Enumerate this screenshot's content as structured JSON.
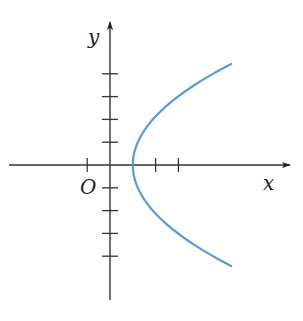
{
  "chart_data": {
    "type": "line",
    "title": "",
    "xlabel": "x",
    "ylabel": "y",
    "origin_label": "O",
    "xlim": [
      -4.4,
      7.6
    ],
    "ylim": [
      -5.9,
      6.3
    ],
    "x_ticks": [
      -1,
      2,
      3
    ],
    "y_ticks": [
      -4,
      -3,
      -2,
      -1,
      1,
      2,
      3,
      4
    ],
    "grid": false,
    "legend": null,
    "series": [
      {
        "name": "curve",
        "description": "parabola opening right, vertex at (1, 0)",
        "equation": "x = 1 + 0.22 y^2",
        "color": "#5b9bd5",
        "points": [
          {
            "x": 5.32,
            "y": 4.43
          },
          {
            "x": 3.2,
            "y": 3.16
          },
          {
            "x": 1.88,
            "y": 2
          },
          {
            "x": 1.22,
            "y": 1
          },
          {
            "x": 1,
            "y": 0
          },
          {
            "x": 1.22,
            "y": -1
          },
          {
            "x": 1.88,
            "y": -2
          },
          {
            "x": 3.2,
            "y": -3.16
          },
          {
            "x": 5.32,
            "y": -4.43
          }
        ]
      }
    ]
  },
  "colors": {
    "axis": "#333333",
    "curve": "#5b9bd5"
  }
}
